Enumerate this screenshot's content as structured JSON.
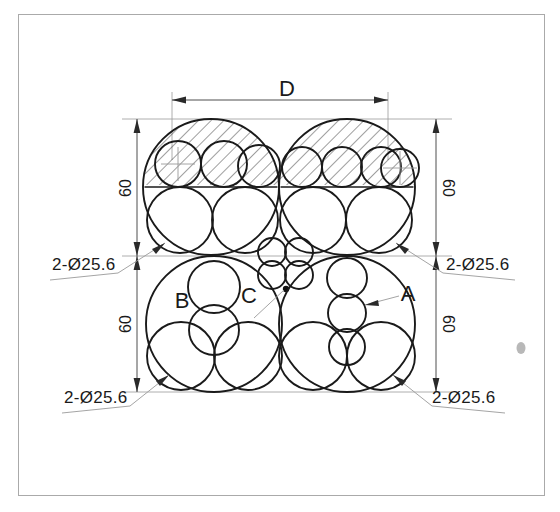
{
  "drawing": {
    "title_label": "D",
    "dimensions": {
      "width_label": "D",
      "height_left_top": "60",
      "height_right_top": "60",
      "height_left_bottom": "60",
      "height_right_bottom": "60"
    },
    "callouts": [
      {
        "id": "callout-top-left",
        "text": "2-Ø25.6"
      },
      {
        "id": "callout-top-right",
        "text": "2-Ø25.6"
      },
      {
        "id": "callout-bottom-left",
        "text": "2-Ø25.6"
      },
      {
        "id": "callout-bottom-right",
        "text": "2-Ø25.6"
      }
    ],
    "region_labels": [
      {
        "id": "label-a",
        "text": "A"
      },
      {
        "id": "label-b",
        "text": "B"
      },
      {
        "id": "label-c",
        "text": "C"
      }
    ],
    "colors": {
      "object_line": "#1a1a1a",
      "dimension_line": "#3a3a3a",
      "extension_line": "#9a9a9a",
      "sheet_border": "#aaaaaa",
      "background": "#ffffff"
    },
    "notes": {
      "nominal_diameter": "25.6",
      "quantity_prefix": "2-",
      "diameter_symbol": "Ø",
      "vertical_dim_value": "60"
    }
  }
}
